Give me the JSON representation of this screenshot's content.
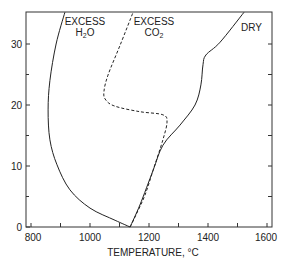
{
  "chart_data": {
    "type": "line",
    "title": "",
    "xlabel": "TEMPERATURE, °C",
    "ylabel": "",
    "xlim": [
      783,
      1614
    ],
    "ylim": [
      0,
      35.2
    ],
    "x_ticks": [
      800,
      900,
      1000,
      1100,
      1200,
      1300,
      1400,
      1500,
      1600
    ],
    "x_tick_labels": [
      "800",
      "1000",
      "1200",
      "1400",
      "1600"
    ],
    "y_ticks": [
      0,
      5,
      10,
      15,
      20,
      25,
      30
    ],
    "y_tick_labels": [
      "0",
      "10",
      "20",
      "30"
    ],
    "grid": false,
    "legend": "inline labels",
    "series": [
      {
        "name": "EXCESS H2O",
        "label_line1": "EXCESS",
        "label_line2": "H",
        "label_sub": "2",
        "label_line2_end": "O",
        "style": "solid",
        "points": [
          [
            1136,
            0
          ],
          [
            1085,
            1.1
          ],
          [
            1000,
            3.1
          ],
          [
            932,
            6.1
          ],
          [
            888,
            10.2
          ],
          [
            864,
            14.3
          ],
          [
            858,
            19.2
          ],
          [
            864,
            24
          ],
          [
            885,
            30
          ],
          [
            915,
            35.2
          ]
        ]
      },
      {
        "name": "EXCESS CO2",
        "label_line1": "EXCESS",
        "label_line2": "CO",
        "label_sub": "2",
        "label_line2_end": "",
        "style": "dashed",
        "points": [
          [
            1136,
            0
          ],
          [
            1156,
            2
          ],
          [
            1186,
            5.2
          ],
          [
            1214,
            9.3
          ],
          [
            1247,
            14.3
          ],
          [
            1261,
            17.2
          ],
          [
            1247,
            18.4
          ],
          [
            1169,
            18.9
          ],
          [
            1085,
            19.8
          ],
          [
            1054,
            20.8
          ],
          [
            1047,
            22.1
          ],
          [
            1061,
            24.9
          ],
          [
            1102,
            29.8
          ],
          [
            1146,
            35.2
          ]
        ]
      },
      {
        "name": "DRY",
        "label_line1": "DRY",
        "style": "solid",
        "points": [
          [
            1136,
            0
          ],
          [
            1169,
            3.6
          ],
          [
            1214,
            9.3
          ],
          [
            1247,
            13.4
          ],
          [
            1305,
            16.7
          ],
          [
            1356,
            20
          ],
          [
            1376,
            23.3
          ],
          [
            1383,
            26.6
          ],
          [
            1393,
            28.2
          ],
          [
            1441,
            30.3
          ],
          [
            1522,
            35.2
          ]
        ]
      }
    ]
  },
  "labels": {
    "xaxis_title": "TEMPERATURE, °C",
    "h2o_line1": "EXCESS",
    "h2o_line2": "H",
    "h2o_sub": "2",
    "h2o_end": "O",
    "co2_line1": "EXCESS",
    "co2_line2": "CO",
    "co2_sub": "2",
    "dry": "DRY",
    "xt0": "800",
    "xt1": "1000",
    "xt2": "1200",
    "xt3": "1400",
    "xt4": "1600",
    "yt0": "0",
    "yt1": "10",
    "yt2": "20",
    "yt3": "30"
  },
  "colors": {
    "line": "#222222",
    "axis": "#333333"
  }
}
